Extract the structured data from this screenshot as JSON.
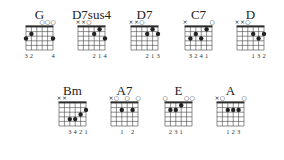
{
  "colors": {
    "ink": "#222222",
    "grid": "#444444",
    "background": "#ffffff"
  },
  "chords": [
    {
      "name": "G",
      "x": 16,
      "y": 4,
      "markers": [
        "",
        "",
        "",
        "o",
        "o",
        "o"
      ],
      "dots": [
        [
          1,
          2
        ],
        [
          0,
          3
        ],
        [
          5,
          3
        ]
      ],
      "fingering": [
        "3",
        "2",
        "",
        "",
        "",
        "4"
      ]
    },
    {
      "name": "D7sus4",
      "x": 68,
      "y": 4,
      "markers": [
        "x",
        "x",
        "o",
        "",
        "",
        ""
      ],
      "dots": [
        [
          4,
          1
        ],
        [
          3,
          2
        ],
        [
          5,
          3
        ]
      ],
      "fingering": [
        "",
        "",
        "",
        "2",
        "1",
        "4"
      ]
    },
    {
      "name": "D7",
      "x": 121,
      "y": 4,
      "markers": [
        "x",
        "x",
        "o",
        "",
        "",
        ""
      ],
      "dots": [
        [
          4,
          1
        ],
        [
          3,
          2
        ],
        [
          5,
          2
        ]
      ],
      "fingering": [
        "",
        "",
        "",
        "2",
        "1",
        "3"
      ]
    },
    {
      "name": "C7",
      "x": 175,
      "y": 4,
      "markers": [
        "x",
        "",
        "",
        "",
        "",
        "o"
      ],
      "dots": [
        [
          4,
          1
        ],
        [
          2,
          2
        ],
        [
          1,
          3
        ],
        [
          3,
          3
        ]
      ],
      "fingering": [
        "",
        "3",
        "2",
        "4",
        "1",
        ""
      ]
    },
    {
      "name": "D",
      "x": 227,
      "y": 4,
      "markers": [
        "x",
        "x",
        "o",
        "",
        "",
        ""
      ],
      "dots": [
        [
          3,
          2
        ],
        [
          5,
          2
        ],
        [
          4,
          3
        ]
      ],
      "fingering": [
        "",
        "",
        "",
        "1",
        "3",
        "2"
      ]
    },
    {
      "name": "Bm",
      "x": 49,
      "y": 80,
      "markers": [
        "x",
        "x",
        "",
        "",
        "",
        ""
      ],
      "dots": [
        [
          5,
          2
        ],
        [
          4,
          3
        ],
        [
          2,
          4
        ],
        [
          3,
          4
        ]
      ],
      "fingering": [
        "",
        "",
        "3",
        "4",
        "2",
        "1"
      ]
    },
    {
      "name": "A7",
      "x": 101,
      "y": 80,
      "markers": [
        "x",
        "o",
        "",
        "o",
        "",
        "o"
      ],
      "dots": [
        [
          2,
          2
        ],
        [
          4,
          2
        ]
      ],
      "fingering": [
        "",
        "",
        "1",
        "",
        "2",
        ""
      ]
    },
    {
      "name": "E",
      "x": 155,
      "y": 80,
      "markers": [
        "o",
        "",
        "",
        "",
        "o",
        "o"
      ],
      "dots": [
        [
          3,
          1
        ],
        [
          1,
          2
        ],
        [
          2,
          2
        ]
      ],
      "fingering": [
        "",
        "2",
        "3",
        "1",
        "",
        ""
      ]
    },
    {
      "name": "A",
      "x": 207,
      "y": 80,
      "markers": [
        "x",
        "o",
        "",
        "",
        "",
        "o"
      ],
      "dots": [
        [
          2,
          2
        ],
        [
          3,
          2
        ],
        [
          4,
          2
        ]
      ],
      "fingering": [
        "",
        "",
        "1",
        "2",
        "3",
        ""
      ]
    }
  ]
}
